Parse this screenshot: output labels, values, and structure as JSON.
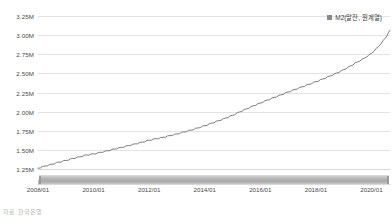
{
  "chart_data": {
    "type": "line",
    "title": "",
    "subtitle": "",
    "xlabel": "",
    "ylabel": "",
    "ylim": [
      1.125,
      3.3125
    ],
    "xlim": [
      "2008/01",
      "2020/09"
    ],
    "grid": true,
    "legend_position": "top-right",
    "y_ticks": [
      "1.25M",
      "1.50M",
      "1.75M",
      "2.00M",
      "2.25M",
      "2.50M",
      "2.75M",
      "3.00M",
      "3.25M"
    ],
    "y_tick_values": [
      1.25,
      1.5,
      1.75,
      2.0,
      2.25,
      2.5,
      2.75,
      3.0,
      3.25
    ],
    "x_ticks": [
      "2008/01",
      "2010/01",
      "2012/01",
      "2014/01",
      "2016/01",
      "2018/01",
      "2020/01"
    ],
    "series": [
      {
        "name": "M2(말잔, 원계열)",
        "color": "#6e6e6e",
        "x": [
          "2008/01",
          "2008/04",
          "2008/07",
          "2008/10",
          "2009/01",
          "2009/04",
          "2009/07",
          "2009/10",
          "2010/01",
          "2010/04",
          "2010/07",
          "2010/10",
          "2011/01",
          "2011/04",
          "2011/07",
          "2011/10",
          "2012/01",
          "2012/04",
          "2012/07",
          "2012/10",
          "2013/01",
          "2013/04",
          "2013/07",
          "2013/10",
          "2014/01",
          "2014/04",
          "2014/07",
          "2014/10",
          "2015/01",
          "2015/04",
          "2015/07",
          "2015/10",
          "2016/01",
          "2016/04",
          "2016/07",
          "2016/10",
          "2017/01",
          "2017/04",
          "2017/07",
          "2017/10",
          "2018/01",
          "2018/04",
          "2018/07",
          "2018/10",
          "2019/01",
          "2019/04",
          "2019/07",
          "2019/10",
          "2020/01",
          "2020/04",
          "2020/07",
          "2020/09"
        ],
        "values": [
          1.266,
          1.294,
          1.318,
          1.345,
          1.367,
          1.392,
          1.415,
          1.438,
          1.452,
          1.472,
          1.493,
          1.515,
          1.537,
          1.56,
          1.582,
          1.605,
          1.63,
          1.65,
          1.668,
          1.69,
          1.712,
          1.738,
          1.762,
          1.79,
          1.82,
          1.852,
          1.885,
          1.918,
          1.955,
          1.998,
          2.038,
          2.078,
          2.115,
          2.152,
          2.188,
          2.222,
          2.258,
          2.292,
          2.325,
          2.358,
          2.392,
          2.428,
          2.466,
          2.505,
          2.548,
          2.598,
          2.65,
          2.7,
          2.762,
          2.85,
          2.96,
          3.06
        ]
      }
    ]
  },
  "legend": {
    "entries": [
      {
        "label": "M2(말잔, 원계열)",
        "swatch_color": "#8a8a8a"
      }
    ]
  },
  "range_slider": {
    "name": "range-slider",
    "start_label": "2008/01",
    "end_label": "2020/09"
  },
  "footer": {
    "clipped_text": "자료: 한국은행"
  },
  "colors": {
    "line": "#6e6e6e",
    "grid": "#e3e3e3",
    "axis": "#cfcfcf",
    "text": "#4a4a4a",
    "slider": "#b4b4b4"
  }
}
